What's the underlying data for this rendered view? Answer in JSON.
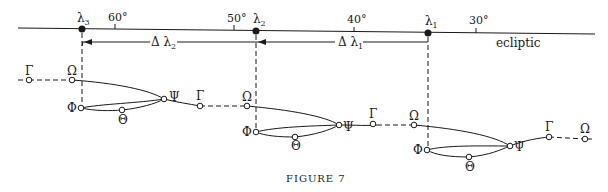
{
  "figure": {
    "caption": "Figure 7",
    "caption_display": "FIGURE 7"
  },
  "ecliptic": {
    "label": "ecliptic",
    "ticks": [
      {
        "label": "60°",
        "x": 115
      },
      {
        "label": "50°",
        "x": 234
      },
      {
        "label": "40°",
        "x": 354
      },
      {
        "label": "30°",
        "x": 476
      }
    ],
    "positions": [
      {
        "symbol": "λ",
        "sub": "3",
        "x": 82
      },
      {
        "symbol": "λ",
        "sub": "2",
        "x": 256
      },
      {
        "symbol": "λ",
        "sub": "1",
        "x": 428
      }
    ]
  },
  "intervals": [
    {
      "symbol": "Δ λ",
      "sub": "2",
      "from": "λ3",
      "to": "λ2"
    },
    {
      "symbol": "Δ λ",
      "sub": "1",
      "from": "λ2",
      "to": "λ1"
    }
  ],
  "orbit_points": {
    "gamma": "Γ",
    "omega": "Ω",
    "psi": "Ψ",
    "phi": "Φ",
    "theta": "Θ"
  },
  "colors": {
    "ink": "#1a1a1a",
    "background": "#ffffff"
  }
}
